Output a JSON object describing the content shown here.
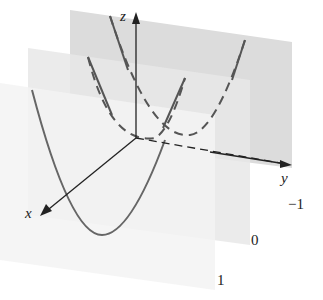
{
  "diagram": {
    "axes": {
      "x": "x",
      "y": "y",
      "z": "z"
    },
    "planes": [
      {
        "label": "−1",
        "color": "#d8d8d8"
      },
      {
        "label": "0",
        "color": "#e6e6e6"
      },
      {
        "label": "1",
        "color": "#f0f0f0"
      }
    ],
    "colors": {
      "curve": "#666666",
      "axis": "#222222"
    }
  }
}
